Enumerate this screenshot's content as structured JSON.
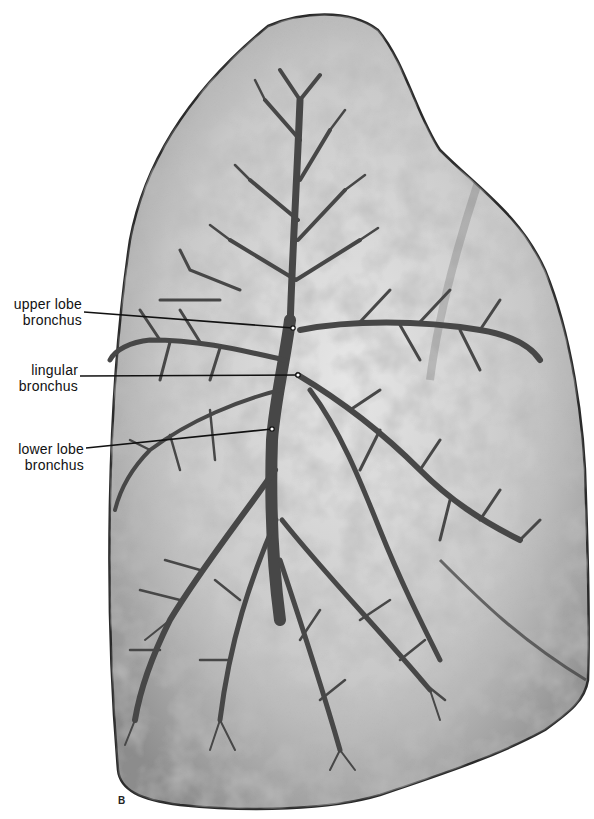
{
  "figure": {
    "type": "anatomical-illustration",
    "panel_letter": "B",
    "colors": {
      "background": "#ffffff",
      "lung_tissue": "#b8b8b8",
      "lung_highlight": "#e8e8e8",
      "bronchi": "#4a4a4a",
      "outline": "#2a2a2a",
      "label_text": "#111111"
    }
  },
  "labels": [
    {
      "line1": "upper lobe",
      "line2": "bronchus",
      "pointer": [
        293,
        328
      ]
    },
    {
      "line1": "lingular",
      "line2": "bronchus",
      "pointer": [
        298,
        375
      ]
    },
    {
      "line1": "lower lobe",
      "line2": "bronchus",
      "pointer": [
        272,
        429
      ]
    }
  ]
}
